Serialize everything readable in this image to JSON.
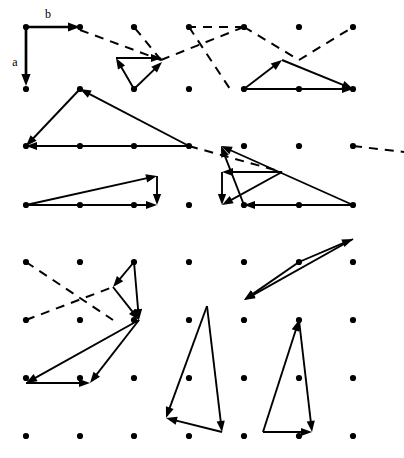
{
  "figure": {
    "background_color": "#ffffff",
    "ink_color": "#000000",
    "width": 404,
    "height": 458,
    "basis_labels": {
      "a": "a",
      "b": "b"
    }
  },
  "chart_data": {
    "type": "scatter",
    "title": "",
    "xlabel": "",
    "ylabel": "",
    "grid": false,
    "legend": null,
    "lattice": {
      "description": "Rectangular point lattice of filled dots",
      "columns_x": [
        26,
        80,
        134,
        189,
        244,
        299,
        353
      ],
      "rows_y": [
        27,
        89,
        146,
        205,
        262,
        320,
        378,
        436
      ],
      "dot_radius": 3.1,
      "dot_count": 56
    },
    "basis_vectors": [
      {
        "name": "b",
        "from": [
          26,
          27
        ],
        "to": [
          80,
          27
        ],
        "style": "solid",
        "label": "b",
        "label_pos": [
          48,
          18
        ]
      },
      {
        "name": "a",
        "from": [
          26,
          29
        ],
        "to": [
          26,
          86
        ],
        "style": "solid",
        "label": "a",
        "label_pos": [
          16,
          63
        ]
      }
    ],
    "dashed_segments": [
      [
        [
          80,
          30
        ],
        [
          161,
          60
        ]
      ],
      [
        [
          161,
          60
        ],
        [
          134,
          27
        ]
      ],
      [
        [
          161,
          60
        ],
        [
          244,
          27
        ]
      ],
      [
        [
          244,
          27
        ],
        [
          189,
          27
        ]
      ],
      [
        [
          189,
          27
        ],
        [
          230,
          89
        ]
      ],
      [
        [
          244,
          27
        ],
        [
          299,
          60
        ]
      ],
      [
        [
          299,
          60
        ],
        [
          353,
          27
        ]
      ],
      [
        [
          189,
          146
        ],
        [
          282,
          172
        ]
      ],
      [
        [
          353,
          146
        ],
        [
          404,
          152
        ]
      ],
      [
        [
          26,
          262
        ],
        [
          113,
          320
        ]
      ],
      [
        [
          26,
          320
        ],
        [
          113,
          287
        ]
      ]
    ],
    "solid_triangles": [
      {
        "id": "t1-upper-left",
        "vertices": [
          [
            80,
            89
          ],
          [
            26,
            146
          ],
          [
            189,
            146
          ]
        ],
        "arrows": [
          {
            "from": [
              80,
              89
            ],
            "to": [
              26,
              146
            ]
          },
          {
            "from": [
              189,
              146
            ],
            "to": [
              26,
              146
            ]
          },
          {
            "from": [
              189,
              146
            ],
            "to": [
              80,
              89
            ]
          }
        ]
      },
      {
        "id": "t2-upper-mid",
        "vertices": [
          [
            134,
            89
          ],
          [
            116,
            60
          ],
          [
            162,
            62
          ]
        ],
        "arrows": [
          {
            "from": [
              134,
              89
            ],
            "to": [
              116,
              58
            ]
          },
          {
            "from": [
              116,
              58
            ],
            "to": [
              162,
              58
            ]
          },
          {
            "from": [
              134,
              89
            ],
            "to": [
              162,
              62
            ]
          }
        ]
      },
      {
        "id": "t3-left-low",
        "vertices": [
          [
            26,
            205
          ],
          [
            157,
            176
          ],
          [
            157,
            205
          ]
        ],
        "arrows": [
          {
            "from": [
              26,
              205
            ],
            "to": [
              157,
              176
            ]
          },
          {
            "from": [
              157,
              176
            ],
            "to": [
              157,
              205
            ]
          },
          {
            "from": [
              26,
              205
            ],
            "to": [
              157,
              205
            ]
          }
        ]
      },
      {
        "id": "t4-right-upper",
        "vertices": [
          [
            244,
            89
          ],
          [
            282,
            60
          ],
          [
            353,
            89
          ]
        ],
        "arrows": [
          {
            "from": [
              244,
              89
            ],
            "to": [
              282,
              60
            ]
          },
          {
            "from": [
              282,
              60
            ],
            "to": [
              353,
              89
            ]
          },
          {
            "from": [
              244,
              89
            ],
            "to": [
              353,
              89
            ]
          }
        ]
      },
      {
        "id": "t5-right-mid",
        "vertices": [
          [
            221,
            146
          ],
          [
            244,
            205
          ],
          [
            353,
            205
          ]
        ],
        "arrows": [
          {
            "from": [
              244,
              205
            ],
            "to": [
              221,
              146
            ]
          },
          {
            "from": [
              353,
              205
            ],
            "to": [
              221,
              146
            ]
          },
          {
            "from": [
              353,
              205
            ],
            "to": [
              244,
              205
            ]
          }
        ]
      },
      {
        "id": "t6-right-low",
        "vertices": [
          [
            282,
            172
          ],
          [
            222,
            172
          ],
          [
            222,
            205
          ]
        ],
        "arrows": [
          {
            "from": [
              282,
              172
            ],
            "to": [
              222,
              172
            ]
          },
          {
            "from": [
              222,
              172
            ],
            "to": [
              222,
              205
            ]
          },
          {
            "from": [
              282,
              172
            ],
            "to": [
              222,
              205
            ]
          }
        ]
      },
      {
        "id": "t7-lower-left-upper",
        "vertices": [
          [
            134,
            262
          ],
          [
            113,
            287
          ],
          [
            139,
            320
          ]
        ],
        "arrows": [
          {
            "from": [
              134,
              262
            ],
            "to": [
              113,
              287
            ]
          },
          {
            "from": [
              134,
              262
            ],
            "to": [
              139,
              320
            ]
          },
          {
            "from": [
              113,
              287
            ],
            "to": [
              139,
              320
            ]
          }
        ]
      },
      {
        "id": "t8-lower-left-lower",
        "vertices": [
          [
            139,
            320
          ],
          [
            26,
            383
          ],
          [
            90,
            383
          ]
        ],
        "arrows": [
          {
            "from": [
              139,
              320
            ],
            "to": [
              26,
              383
            ]
          },
          {
            "from": [
              139,
              320
            ],
            "to": [
              90,
              383
            ]
          },
          {
            "from": [
              26,
              383
            ],
            "to": [
              90,
              383
            ]
          }
        ]
      },
      {
        "id": "t9-mid-lower",
        "vertices": [
          [
            207,
            306
          ],
          [
            222,
            432
          ],
          [
            166,
            418
          ]
        ],
        "arrows": [
          {
            "from": [
              207,
              306
            ],
            "to": [
              222,
              432
            ]
          },
          {
            "from": [
              207,
              306
            ],
            "to": [
              166,
              418
            ]
          },
          {
            "from": [
              222,
              432
            ],
            "to": [
              166,
              418
            ]
          }
        ]
      },
      {
        "id": "t10-right-mid-lower",
        "vertices": [
          [
            299,
            262
          ],
          [
            353,
            239
          ],
          [
            244,
            300
          ]
        ],
        "arrows": [
          {
            "from": [
              299,
              262
            ],
            "to": [
              353,
              239
            ]
          },
          {
            "from": [
              353,
              239
            ],
            "to": [
              244,
              300
            ]
          },
          {
            "from": [
              299,
              262
            ],
            "to": [
              244,
              300
            ]
          }
        ]
      },
      {
        "id": "t11-right-lower",
        "vertices": [
          [
            299,
            320
          ],
          [
            312,
            432
          ],
          [
            263,
            432
          ]
        ],
        "arrows": [
          {
            "from": [
              263,
              432
            ],
            "to": [
              299,
              320
            ]
          },
          {
            "from": [
              299,
              320
            ],
            "to": [
              312,
              432
            ]
          },
          {
            "from": [
              263,
              432
            ],
            "to": [
              312,
              432
            ]
          }
        ]
      }
    ]
  }
}
